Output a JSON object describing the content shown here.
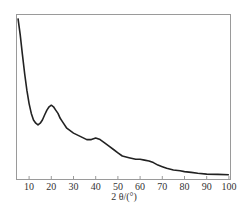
{
  "chart_data": {
    "type": "line",
    "title": "",
    "xlabel": "2 θ/(°)",
    "ylabel": "",
    "xlim": [
      5,
      100
    ],
    "ylim": [
      0,
      100
    ],
    "grid": false,
    "legend": null,
    "x_ticks": [
      10,
      20,
      30,
      40,
      50,
      60,
      70,
      80,
      90,
      100
    ],
    "y_ticks": [],
    "series": [
      {
        "name": "XRD pattern",
        "x": [
          5,
          6,
          7,
          8,
          9,
          10,
          11,
          12,
          13,
          14,
          15,
          16,
          17,
          18,
          19,
          20,
          21,
          22,
          23,
          24,
          25,
          27,
          30,
          33,
          36,
          38,
          40,
          42,
          44,
          46,
          48,
          50,
          52,
          55,
          58,
          60,
          62,
          64,
          66,
          68,
          70,
          72,
          75,
          78,
          80,
          83,
          86,
          90,
          95,
          100
        ],
        "values": [
          98,
          88,
          76,
          64,
          54,
          46,
          40,
          36,
          34,
          33,
          34,
          36,
          39,
          42,
          44,
          45,
          44,
          42,
          40,
          37,
          35,
          31,
          28,
          26,
          24,
          24,
          25,
          24,
          22,
          20,
          18,
          16,
          14,
          13,
          12,
          12,
          11.5,
          11,
          10,
          8.5,
          7.5,
          6.5,
          5.5,
          5,
          4.5,
          4,
          3.5,
          3,
          2.8,
          2.6
        ]
      }
    ]
  },
  "axis": {
    "x_title": "2 θ/(°)",
    "x_tick_labels": [
      "10",
      "20",
      "30",
      "40",
      "50",
      "60",
      "70",
      "80",
      "90",
      "100"
    ]
  }
}
